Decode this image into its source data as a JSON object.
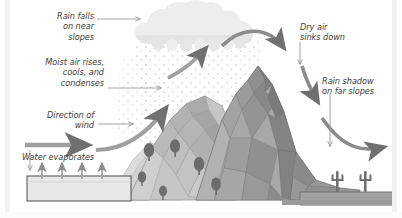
{
  "diagram": {
    "labels": {
      "rain_falls": "Rain falls\non near\nslopes",
      "moist_air": "Moist air rises,\ncools, and\ncondenses",
      "direction_wind": "Direction of\nwind",
      "water_evaporates": "Water evaporates",
      "dry_air": "Dry air\nsinks down",
      "rain_shadow": "Rain shadow\non far slopes"
    },
    "elements": {
      "cloud": "cloud",
      "rain": "rain-dots",
      "mountain": "mountain-range",
      "trees": "coniferous-trees",
      "water_body": "water-body",
      "cacti": "cacti",
      "ground_left": "wet-ground",
      "ground_right": "dry-ground"
    },
    "colors": {
      "background": "#ffffff",
      "text": "#3c3c3c",
      "arrow": "#8c8c8c",
      "arrow_dark": "#6e6e6e",
      "cloud": "#ededed",
      "cloud_shade": "#e0e0e0",
      "rain_dot": "#c9c9c9",
      "mountain_light": "#cdcdcd",
      "mountain_mid": "#b4b4b4",
      "mountain_dark": "#9a9a9a",
      "mountain_darkest": "#878787",
      "tree": "#6b6b6b",
      "water": "#e6e6e6",
      "outline": "#5a5a5a",
      "edge_band": "#f2f2f2"
    }
  }
}
